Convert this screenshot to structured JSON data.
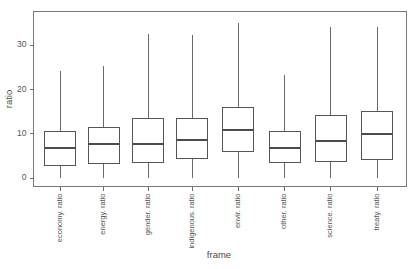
{
  "chart_data": {
    "type": "box",
    "title": "",
    "xlabel": "frame",
    "ylabel": "ratio",
    "categories": [
      "economy. ratio",
      "energy. ratio",
      "gender. ratio",
      "indigenous. ratio",
      "envir. ratio",
      "other. ratio",
      "science. ratio",
      "treaty. ratio"
    ],
    "ylim": [
      -1.5,
      36.5
    ],
    "yticks": [
      0,
      10,
      20,
      30
    ],
    "ytick_labels": [
      "0",
      "10",
      "20",
      "30"
    ],
    "grid": false,
    "legend": "none",
    "boxes": [
      {
        "category": "economy. ratio",
        "whisker_low": 0.0,
        "q1": 2.9,
        "median": 6.8,
        "q3": 10.6,
        "whisker_high": 24.1
      },
      {
        "category": "energy. ratio",
        "whisker_low": 0.0,
        "q1": 3.2,
        "median": 7.7,
        "q3": 11.5,
        "whisker_high": 25.3
      },
      {
        "category": "gender. ratio",
        "whisker_low": 0.0,
        "q1": 3.6,
        "median": 7.7,
        "q3": 13.5,
        "whisker_high": 32.5
      },
      {
        "category": "indigenous. ratio",
        "whisker_low": 0.0,
        "q1": 4.5,
        "median": 8.6,
        "q3": 13.5,
        "whisker_high": 32.3
      },
      {
        "category": "envir. ratio",
        "whisker_low": 0.0,
        "q1": 5.9,
        "median": 10.8,
        "q3": 15.8,
        "whisker_high": 35.0
      },
      {
        "category": "other. ratio",
        "whisker_low": 0.0,
        "q1": 3.4,
        "median": 6.8,
        "q3": 10.6,
        "whisker_high": 23.2
      },
      {
        "category": "science. ratio",
        "whisker_low": 0.0,
        "q1": 3.8,
        "median": 8.3,
        "q3": 14.2,
        "whisker_high": 34.1
      },
      {
        "category": "treaty. ratio",
        "whisker_low": 0.0,
        "q1": 4.1,
        "median": 9.9,
        "q3": 14.9,
        "whisker_high": 34.1
      }
    ],
    "colors": {
      "box_stroke": "#555555",
      "median_stroke": "#4b4b4b",
      "whisker_stroke": "#6a6a6a",
      "frame_stroke": "#7a7a7a",
      "background": "#ffffff",
      "text": "#4a4a4a"
    }
  }
}
